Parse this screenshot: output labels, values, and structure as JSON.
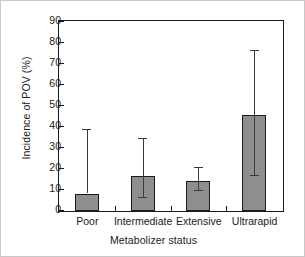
{
  "chart_data": {
    "type": "bar",
    "title": "",
    "xlabel": "Metabolizer status",
    "ylabel": "Incidence of POV (%)",
    "categories": [
      "Poor",
      "Intermediate",
      "Extensive",
      "Ultrarapid"
    ],
    "values": [
      8,
      16.5,
      14.5,
      45.5
    ],
    "error_low": [
      8,
      6,
      9.5,
      16.5
    ],
    "error_high": [
      38.5,
      34.5,
      20.5,
      76
    ],
    "ylim": [
      0,
      90
    ],
    "ytick_labels": [
      "0",
      "10",
      "20",
      "30",
      "40",
      "50",
      "60",
      "70",
      "80",
      "90"
    ],
    "ytick_values": [
      0,
      10,
      20,
      30,
      40,
      50,
      60,
      70,
      80,
      90
    ],
    "grid": false,
    "legend": "none",
    "bar_color": "#8e8e8e",
    "bar_edge_color": "#1a1a1a",
    "error_color": "#3a3a3a",
    "axis_color": "#1a1a1a",
    "frame_color": "#c9c9c9",
    "background": "#ffffff"
  }
}
